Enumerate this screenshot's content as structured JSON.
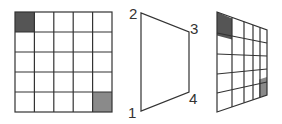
{
  "diagram": {
    "left_grid": {
      "rows": 5,
      "cols": 5,
      "shaded_cells": [
        {
          "row": 0,
          "col": 0,
          "color": "#555555"
        },
        {
          "row": 4,
          "col": 4,
          "color": "#8a8a8a"
        }
      ]
    },
    "quadrilateral": {
      "corner_labels": [
        "1",
        "2",
        "3",
        "4"
      ]
    },
    "right_grid": {
      "rows": 5,
      "cols": 5,
      "shaded_cells": [
        {
          "row": 0,
          "col": 0,
          "color": "#555555"
        },
        {
          "row": 4,
          "col": 4,
          "color": "#8a8a8a"
        }
      ]
    },
    "line_color": "#333333"
  }
}
